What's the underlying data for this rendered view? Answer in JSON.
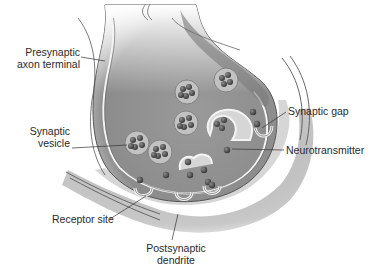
{
  "figure": {
    "colors": {
      "background": "#ffffff",
      "presynaptic_fill_dark": "#8a8a8a",
      "presynaptic_fill_light": "#d8d8d8",
      "postsynaptic_fill": "#b8b8b8",
      "gap_fill": "#d2d2d2",
      "membrane": "#f2f2f2",
      "outline": "#555555",
      "vesicle_fill": "#c4c4c4",
      "neurotransmitter": "#4a4a4a",
      "label_text": "#2a2a2a",
      "leader_line": "#333333"
    }
  },
  "labels": {
    "presynaptic_axon_terminal": {
      "line1": "Presynaptic",
      "line2": "axon terminal"
    },
    "synaptic_vesicle": {
      "line1": "Synaptic",
      "line2": "vesicle"
    },
    "synaptic_gap": "Synaptic gap",
    "neurotransmitter": "Neurotransmitter",
    "receptor_site": "Receptor site",
    "postsynaptic_dendrite": {
      "line1": "Postsynaptic",
      "line2": "dendrite"
    }
  }
}
